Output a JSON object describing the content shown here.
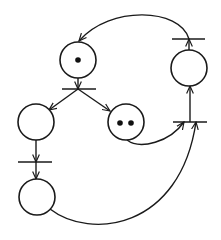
{
  "diagram": {
    "type": "petri-net",
    "colors": {
      "stroke": "#1a1a1a",
      "background": "#ffffff",
      "token": "#111111"
    },
    "places": [
      {
        "id": "P1",
        "cx": 78,
        "cy": 60,
        "r": 18,
        "tokens": 1
      },
      {
        "id": "P2",
        "cx": 36,
        "cy": 122,
        "r": 18,
        "tokens": 0
      },
      {
        "id": "P3",
        "cx": 126,
        "cy": 122,
        "r": 18,
        "tokens": 2
      },
      {
        "id": "P4",
        "cx": 37,
        "cy": 197,
        "r": 18,
        "tokens": 0
      },
      {
        "id": "P5",
        "cx": 189,
        "cy": 68,
        "r": 18,
        "tokens": 0
      }
    ],
    "transitions": [
      {
        "id": "T1",
        "x1": 62,
        "x2": 96,
        "y": 89
      },
      {
        "id": "T2",
        "x1": 18,
        "x2": 52,
        "y": 162
      },
      {
        "id": "T3",
        "x1": 173,
        "x2": 207,
        "y": 122
      },
      {
        "id": "T4",
        "x1": 172,
        "x2": 205,
        "y": 39
      }
    ],
    "arcs": [
      {
        "from": "P1",
        "to": "T1"
      },
      {
        "from": "T1",
        "to": "P2"
      },
      {
        "from": "T1",
        "to": "P3"
      },
      {
        "from": "P2",
        "to": "T2"
      },
      {
        "from": "T2",
        "to": "P4"
      },
      {
        "from": "P3",
        "to": "T3"
      },
      {
        "from": "P4",
        "to": "T3"
      },
      {
        "from": "T3",
        "to": "P5"
      },
      {
        "from": "P5",
        "to": "T4"
      },
      {
        "from": "T4",
        "to": "P1"
      }
    ]
  }
}
